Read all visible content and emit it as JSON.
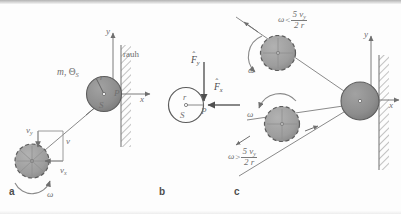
{
  "figure": {
    "caption_letters": {
      "a": "a",
      "b": "b",
      "c": "c"
    },
    "colors": {
      "ball_fill": "#8d8d8d",
      "ball_fill_light": "#a6a6a6",
      "ball_stroke": "#5d5d5d",
      "line": "#7b7b7b",
      "text": "#6f6f6f",
      "wall_hatch": "#8e8e8e",
      "background": "#fdfdfd"
    }
  },
  "panel_a": {
    "letter": "a",
    "wall_label": "rauh",
    "axis_y": "y",
    "axis_x": "x",
    "contact_point": "P",
    "center_label": "S",
    "radius_label": "r",
    "mass_inertia_label_m": "m",
    "mass_inertia_label_theta": "Θ",
    "mass_inertia_sub": "S",
    "velocity_total": "v",
    "velocity_y": "v",
    "velocity_y_sub": "y",
    "velocity_x": "v",
    "velocity_x_sub": "x",
    "omega": "ω"
  },
  "panel_b": {
    "letter": "b",
    "center_label": "S",
    "radius_label": "r",
    "contact_point": "P",
    "force_y": "F",
    "force_y_sub": "y",
    "force_x": "F",
    "force_x_sub": "x",
    "force_hat": "ˆ"
  },
  "panel_c": {
    "letter": "c",
    "axis_y": "y",
    "axis_x": "x",
    "omega_upper": "ω",
    "omega_lower": "ω",
    "condition_upper": {
      "omega": "ω",
      "relation": "<",
      "numerator": "5 v",
      "numerator_sub": "y",
      "denominator": "2 r"
    },
    "condition_lower": {
      "omega": "ω",
      "relation": ">",
      "numerator": "5 v",
      "numerator_sub": "y",
      "denominator": "2 r"
    }
  }
}
